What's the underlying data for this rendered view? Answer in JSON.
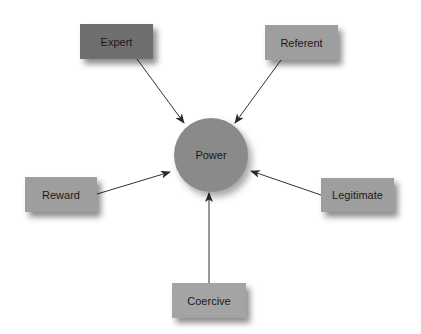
{
  "diagram": {
    "title": "",
    "center": {
      "id": "power",
      "label": "Power",
      "shape": "circle",
      "cx": 211,
      "cy": 155,
      "r": 37,
      "fill": "#8a8a8a"
    },
    "nodes": [
      {
        "id": "expert",
        "label": "Expert",
        "shape": "rect",
        "x": 80,
        "y": 24,
        "w": 73,
        "h": 35,
        "fill": "#6f6f6f"
      },
      {
        "id": "referent",
        "label": "Referent",
        "shape": "rect",
        "x": 265,
        "y": 25,
        "w": 73,
        "h": 35,
        "fill": "#9e9e9e"
      },
      {
        "id": "reward",
        "label": "Reward",
        "shape": "rect",
        "x": 25,
        "y": 177,
        "w": 72,
        "h": 35,
        "fill": "#9e9e9e"
      },
      {
        "id": "legitimate",
        "label": "Legitimate",
        "shape": "rect",
        "x": 321,
        "y": 178,
        "w": 73,
        "h": 34,
        "fill": "#9e9e9e"
      },
      {
        "id": "coercive",
        "label": "Coercive",
        "shape": "rect",
        "x": 172,
        "y": 283,
        "w": 74,
        "h": 35,
        "fill": "#a4a4a4"
      }
    ],
    "edges": [
      {
        "from": "expert",
        "to": "power",
        "x1": 137,
        "y1": 59,
        "x2": 184,
        "y2": 123
      },
      {
        "from": "referent",
        "to": "power",
        "x1": 281,
        "y1": 60,
        "x2": 235,
        "y2": 123
      },
      {
        "from": "reward",
        "to": "power",
        "x1": 97,
        "y1": 194,
        "x2": 170,
        "y2": 172
      },
      {
        "from": "legitimate",
        "to": "power",
        "x1": 321,
        "y1": 195,
        "x2": 251,
        "y2": 171
      },
      {
        "from": "coercive",
        "to": "power",
        "x1": 209,
        "y1": 283,
        "x2": 209,
        "y2": 193
      }
    ],
    "edge_color": "#333333"
  }
}
